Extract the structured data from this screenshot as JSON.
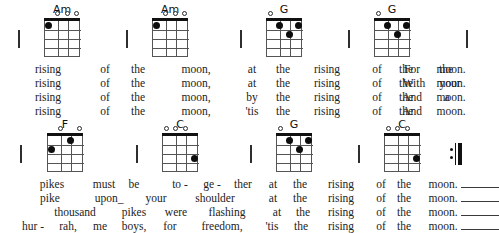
{
  "document": {
    "type": "ukulele-chord-chart",
    "ending_symbol": "repeat-end"
  },
  "chord_shapes": {
    "Am": {
      "name": "Am",
      "opens": [
        2,
        3,
        4
      ],
      "dots": [
        {
          "string": 1,
          "fret": 1
        }
      ]
    },
    "G": {
      "name": "G",
      "opens": [
        1
      ],
      "dots": [
        {
          "string": 2,
          "fret": 1
        },
        {
          "string": 4,
          "fret": 1
        },
        {
          "string": 3,
          "fret": 2
        }
      ]
    },
    "F": {
      "name": "F",
      "opens": [
        2,
        4
      ],
      "dots": [
        {
          "string": 3,
          "fret": 1
        },
        {
          "string": 1,
          "fret": 2
        }
      ]
    },
    "C": {
      "name": "C",
      "opens": [
        1,
        2,
        3
      ],
      "dots": [
        {
          "string": 4,
          "fret": 3
        }
      ]
    }
  },
  "systems": [
    {
      "id": "system-1",
      "chords": [
        {
          "label": "Am",
          "x": 30
        },
        {
          "label": "Am",
          "x": 138
        },
        {
          "label": "G",
          "x": 252
        },
        {
          "label": "G",
          "x": 360
        }
      ],
      "barlines": [
        18,
        126,
        240,
        348,
        466
      ],
      "end_barline": true,
      "repeat_end": false,
      "lyric_lines": [
        {
          "syllables": [
            {
              "text": "rising",
              "x": 48
            },
            {
              "text": "of",
              "x": 105
            },
            {
              "text": "the",
              "x": 138
            },
            {
              "text": "moon,",
              "x": 196
            },
            {
              "text": "at",
              "x": 252
            },
            {
              "text": "the",
              "x": 283
            },
            {
              "text": "rising",
              "x": 327
            },
            {
              "text": "of",
              "x": 377
            },
            {
              "text": "the",
              "x": 406
            },
            {
              "text": "moon.",
              "x": 451
            }
          ]
        },
        {
          "syllables": [
            {
              "text": "rising",
              "x": 48
            },
            {
              "text": "of",
              "x": 105
            },
            {
              "text": "the",
              "x": 138
            },
            {
              "text": "moon,",
              "x": 196
            },
            {
              "text": "at",
              "x": 252
            },
            {
              "text": "the",
              "x": 283
            },
            {
              "text": "rising",
              "x": 327
            },
            {
              "text": "of",
              "x": 377
            },
            {
              "text": "the",
              "x": 406
            },
            {
              "text": "moon.",
              "x": 451
            }
          ]
        },
        {
          "syllables": [
            {
              "text": "rising",
              "x": 48
            },
            {
              "text": "of",
              "x": 105
            },
            {
              "text": "the",
              "x": 138
            },
            {
              "text": "moon,",
              "x": 196
            },
            {
              "text": "by",
              "x": 252
            },
            {
              "text": "the",
              "x": 283
            },
            {
              "text": "rising",
              "x": 327
            },
            {
              "text": "of",
              "x": 377
            },
            {
              "text": "the",
              "x": 406
            },
            {
              "text": "moon.",
              "x": 451
            }
          ]
        },
        {
          "syllables": [
            {
              "text": "rising",
              "x": 48
            },
            {
              "text": "of",
              "x": 105
            },
            {
              "text": "the",
              "x": 138
            },
            {
              "text": "moon,",
              "x": 196
            },
            {
              "text": "'tis",
              "x": 252
            },
            {
              "text": "the",
              "x": 283
            },
            {
              "text": "rising",
              "x": 327
            },
            {
              "text": "of",
              "x": 377
            },
            {
              "text": "the",
              "x": 406
            },
            {
              "text": "moon.",
              "x": 451
            }
          ]
        }
      ],
      "tail_lines": [
        {
          "syllables": [
            {
              "text": "For",
              "x": 412
            },
            {
              "text": "the",
              "x": 446
            }
          ]
        },
        {
          "syllables": [
            {
              "text": "With",
              "x": 414
            },
            {
              "text": "your",
              "x": 450
            }
          ]
        },
        {
          "syllables": [
            {
              "text": "And",
              "x": 412
            },
            {
              "text": "a",
              "x": 447
            }
          ]
        },
        {
          "syllables": [
            {
              "text": "And",
              "x": 412
            }
          ]
        }
      ]
    },
    {
      "id": "system-2",
      "chords": [
        {
          "label": "F",
          "x": 33
        },
        {
          "label": "C",
          "x": 148
        },
        {
          "label": "G",
          "x": 262
        },
        {
          "label": "C",
          "x": 370
        }
      ],
      "barlines": [
        20,
        136,
        250,
        358
      ],
      "end_barline": false,
      "repeat_end": true,
      "lyric_lines": [
        {
          "syllables": [
            {
              "text": "pikes",
              "x": 52
            },
            {
              "text": "must",
              "x": 104
            },
            {
              "text": "be",
              "x": 134
            },
            {
              "text": "to -",
              "x": 180
            },
            {
              "text": "ge -",
              "x": 212
            },
            {
              "text": "ther",
              "x": 243
            },
            {
              "text": "at",
              "x": 273
            },
            {
              "text": "the",
              "x": 300
            },
            {
              "text": "rising",
              "x": 341
            },
            {
              "text": "of",
              "x": 381
            },
            {
              "text": "the",
              "x": 404
            },
            {
              "text": "moon.",
              "x": 443
            }
          ]
        },
        {
          "syllables": [
            {
              "text": "pike",
              "x": 50
            },
            {
              "text": "upon_",
              "x": 109
            },
            {
              "text": "your",
              "x": 156
            },
            {
              "text": "shoulder",
              "x": 215
            },
            {
              "text": "at",
              "x": 273
            },
            {
              "text": "the",
              "x": 300
            },
            {
              "text": "rising",
              "x": 341
            },
            {
              "text": "of",
              "x": 381
            },
            {
              "text": "the",
              "x": 404
            },
            {
              "text": "moon.",
              "x": 443
            }
          ]
        },
        {
          "syllables": [
            {
              "text": "thousand",
              "x": 75
            },
            {
              "text": "pikes",
              "x": 134
            },
            {
              "text": "were",
              "x": 176
            },
            {
              "text": "flashing",
              "x": 227
            },
            {
              "text": "at",
              "x": 277
            },
            {
              "text": "the",
              "x": 303
            },
            {
              "text": "rising",
              "x": 341
            },
            {
              "text": "of",
              "x": 381
            },
            {
              "text": "the",
              "x": 404
            },
            {
              "text": "moon.",
              "x": 443
            }
          ]
        },
        {
          "syllables": [
            {
              "text": "hur -",
              "x": 33
            },
            {
              "text": "rah,",
              "x": 68
            },
            {
              "text": "me",
              "x": 100
            },
            {
              "text": "boys,",
              "x": 134
            },
            {
              "text": "for",
              "x": 170
            },
            {
              "text": "freedom,",
              "x": 222
            },
            {
              "text": "'tis",
              "x": 272
            },
            {
              "text": "the",
              "x": 301
            },
            {
              "text": "rising",
              "x": 341
            },
            {
              "text": "of",
              "x": 381
            },
            {
              "text": "the",
              "x": 404
            },
            {
              "text": "moon.",
              "x": 443
            }
          ]
        }
      ],
      "extenders": [
        {
          "x": 461,
          "width": 38
        },
        {
          "x": 461,
          "width": 38
        },
        {
          "x": 461,
          "width": 38
        },
        {
          "x": 461,
          "width": 38
        }
      ]
    }
  ]
}
